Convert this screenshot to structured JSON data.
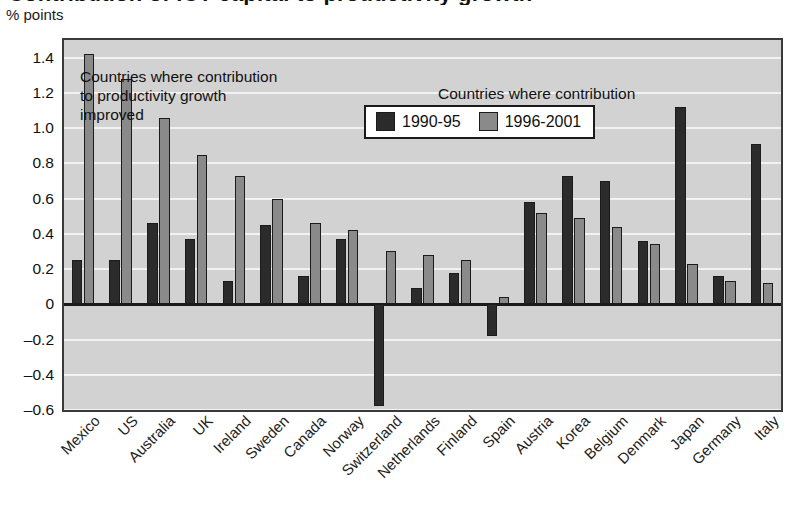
{
  "header": {
    "cropped_title": "Contribution of ICT capital to productivity growth",
    "axis_unit": "% points"
  },
  "legend": {
    "position": "inside-top-center",
    "items": [
      {
        "label": "1990-95",
        "color": "#2b2b2b"
      },
      {
        "label": "1996-2001",
        "color": "#8a8a8a"
      }
    ]
  },
  "annotations": [
    {
      "id": "left",
      "text": "Countries where contribution\nto productivity growth\nimproved"
    },
    {
      "id": "right",
      "text": "Countries where contribution\nto productivity growth\ndeteriorated"
    }
  ],
  "colors": {
    "series_1990_95": "#2b2b2b",
    "series_1996_2001": "#8a8a8a",
    "plot_background": "#d2d2d2",
    "gridline": "#f2f2f2",
    "axis": "#1a1a1a"
  },
  "chart_data": {
    "type": "bar",
    "title": "Contribution of ICT capital to productivity growth",
    "xlabel": "",
    "ylabel": "% points",
    "ylim": [
      -0.6,
      1.5
    ],
    "yticks": [
      1.4,
      1.2,
      1.0,
      0.8,
      0.6,
      0.4,
      0.2,
      0,
      -0.2,
      -0.4,
      -0.6
    ],
    "ytick_labels": [
      "1.4",
      "1.2",
      "1.0",
      "0.8",
      "0.6",
      "0.4",
      "0.2",
      "0",
      "–0.2",
      "–0.4",
      "–0.6"
    ],
    "grid": true,
    "legend_position": "upper center (inset)",
    "categories": [
      "Mexico",
      "US",
      "Australia",
      "UK",
      "Ireland",
      "Sweden",
      "Canada",
      "Norway",
      "Switzerland",
      "Netherlands",
      "Finland",
      "Spain",
      "Austria",
      "Korea",
      "Belgium",
      "Denmark",
      "Japan",
      "Germany",
      "Italy"
    ],
    "series": [
      {
        "name": "1990-95",
        "color": "#2b2b2b",
        "values": [
          0.25,
          0.25,
          0.46,
          0.37,
          0.13,
          0.45,
          0.16,
          0.37,
          -0.58,
          0.09,
          0.18,
          -0.18,
          0.58,
          0.73,
          0.7,
          0.36,
          1.12,
          0.16,
          0.91
        ]
      },
      {
        "name": "1996-2001",
        "color": "#8a8a8a",
        "values": [
          1.42,
          1.28,
          1.06,
          0.85,
          0.73,
          0.6,
          0.46,
          0.42,
          0.3,
          0.28,
          0.25,
          0.04,
          0.52,
          0.49,
          0.44,
          0.34,
          0.23,
          0.13,
          0.12
        ]
      }
    ]
  }
}
